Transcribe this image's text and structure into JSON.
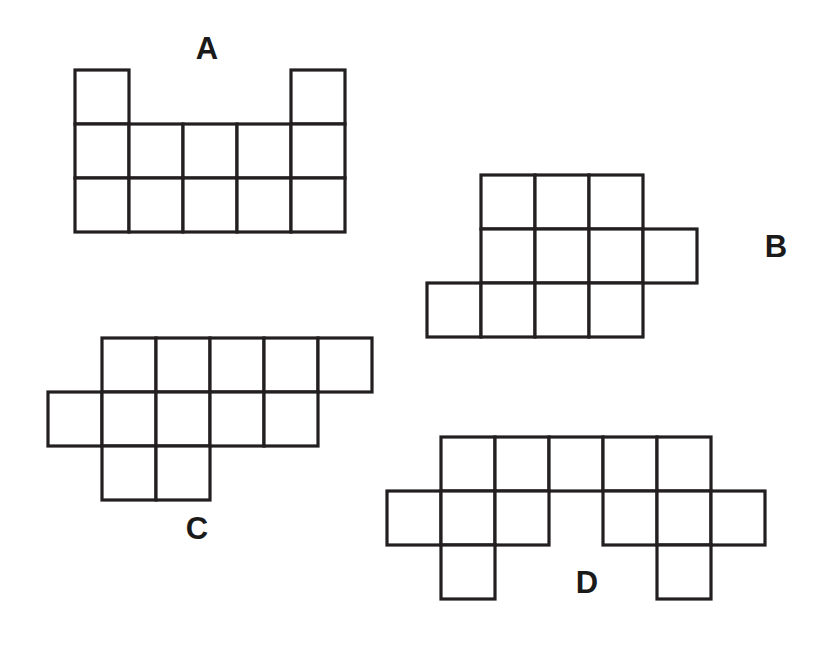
{
  "page": {
    "width": 815,
    "height": 645,
    "background_color": "#ffffff",
    "stroke_color": "#231f20",
    "label_color": "#1a1a1a",
    "cell_size": 54
  },
  "figures": [
    {
      "id": "A",
      "label": "A",
      "label_x": 207,
      "label_y": 51,
      "origin_x": 75,
      "origin_y": 70,
      "cell": 54,
      "columns": 5,
      "rows": 3,
      "square_count": 12,
      "cells": [
        [
          0,
          0
        ],
        [
          4,
          0
        ],
        [
          0,
          1
        ],
        [
          1,
          1
        ],
        [
          2,
          1
        ],
        [
          3,
          1
        ],
        [
          4,
          1
        ],
        [
          0,
          2
        ],
        [
          1,
          2
        ],
        [
          2,
          2
        ],
        [
          3,
          2
        ],
        [
          4,
          2
        ]
      ]
    },
    {
      "id": "B",
      "label": "B",
      "label_x": 776,
      "label_y": 249,
      "origin_x": 427,
      "origin_y": 175,
      "cell": 54,
      "columns": 5,
      "rows": 3,
      "square_count": 11,
      "cells": [
        [
          1,
          0
        ],
        [
          2,
          0
        ],
        [
          3,
          0
        ],
        [
          1,
          1
        ],
        [
          2,
          1
        ],
        [
          3,
          1
        ],
        [
          4,
          1
        ],
        [
          0,
          2
        ],
        [
          1,
          2
        ],
        [
          2,
          2
        ],
        [
          3,
          2
        ]
      ]
    },
    {
      "id": "C",
      "label": "C",
      "label_x": 197,
      "label_y": 531,
      "origin_x": 48,
      "origin_y": 338,
      "cell": 54,
      "columns": 6,
      "rows": 3,
      "square_count": 12,
      "cells": [
        [
          1,
          0
        ],
        [
          2,
          0
        ],
        [
          3,
          0
        ],
        [
          4,
          0
        ],
        [
          5,
          0
        ],
        [
          0,
          1
        ],
        [
          1,
          1
        ],
        [
          2,
          1
        ],
        [
          3,
          1
        ],
        [
          4,
          1
        ],
        [
          1,
          2
        ],
        [
          2,
          2
        ]
      ]
    },
    {
      "id": "D",
      "label": "D",
      "label_x": 587,
      "label_y": 585,
      "origin_x": 387,
      "origin_y": 437,
      "cell": 54,
      "columns": 7,
      "rows": 3,
      "square_count": 13,
      "cells": [
        [
          1,
          0
        ],
        [
          2,
          0
        ],
        [
          3,
          0
        ],
        [
          4,
          0
        ],
        [
          5,
          0
        ],
        [
          0,
          1
        ],
        [
          1,
          1
        ],
        [
          2,
          1
        ],
        [
          4,
          1
        ],
        [
          5,
          1
        ],
        [
          6,
          1
        ],
        [
          1,
          2
        ],
        [
          5,
          2
        ]
      ]
    }
  ]
}
